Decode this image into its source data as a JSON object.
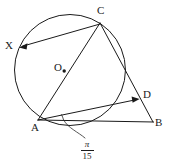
{
  "figure": {
    "type": "circle-geometry-diagram",
    "width": 173,
    "height": 165,
    "background_color": "#ffffff",
    "stroke_color": "#1a1a1a"
  },
  "circle": {
    "name": "circumscribed-circle",
    "center_label": "O",
    "center_x": 70,
    "center_y": 70,
    "radius": 56
  },
  "points": {
    "C": {
      "label": "C",
      "x": 100,
      "y": 23,
      "on_circle": true
    },
    "X": {
      "label": "X",
      "x": 19,
      "y": 47,
      "on_circle": true
    },
    "A": {
      "label": "A",
      "x": 38,
      "y": 120,
      "on_circle": true
    },
    "O": {
      "label": "O",
      "x": 64,
      "y": 71,
      "on_circle": false
    },
    "D": {
      "label": "D",
      "x": 139,
      "y": 99,
      "on_circle": false
    },
    "B": {
      "label": "B",
      "x": 153,
      "y": 122,
      "on_circle": false
    }
  },
  "segments": [
    {
      "name": "segment-CX",
      "from": "C",
      "to": "X",
      "arrow": true
    },
    {
      "name": "segment-AC",
      "from": "A",
      "to": "C",
      "arrow": false
    },
    {
      "name": "segment-CB",
      "from": "C",
      "to": "B",
      "arrow": false
    },
    {
      "name": "segment-AB",
      "from": "A",
      "to": "B",
      "arrow": false
    },
    {
      "name": "segment-AD",
      "from": "A",
      "to": "D",
      "arrow": true
    }
  ],
  "angle": {
    "name": "angle-at-A",
    "vertex": "A",
    "numerator": "π",
    "denominator": "15",
    "value_text": "π/15"
  }
}
